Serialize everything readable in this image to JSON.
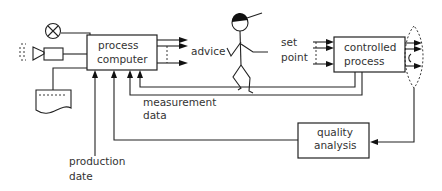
{
  "diagram": {
    "type": "process-control-flow",
    "nodes": {
      "process_computer": {
        "label_line1": "process",
        "label_line2": "computer"
      },
      "controlled_process": {
        "label_line1": "controlled",
        "label_line2": "process"
      },
      "quality_analysis": {
        "label_line1": "quality",
        "label_line2": "analysis"
      },
      "operator": {
        "icon": "stick-figure-operator"
      },
      "alarm_lamp": {
        "icon": "alarm-lamp-icon"
      },
      "loudspeaker": {
        "icon": "loudspeaker-icon"
      },
      "printer_output": {
        "icon": "printout-icon"
      }
    },
    "labels": {
      "advice": "advice",
      "set_point_line1": "set",
      "set_point_line2": "point",
      "measurement_line1": "measurement",
      "measurement_line2": "data",
      "production_line1": "production",
      "production_line2": "date"
    },
    "edges": [
      {
        "from": "process_computer",
        "to": "operator",
        "label": "advice"
      },
      {
        "from": "operator",
        "to": "controlled_process",
        "label": "set point"
      },
      {
        "from": "controlled_process",
        "to": "process_computer",
        "label": "measurement data"
      },
      {
        "from": "controlled_process",
        "to": "quality_analysis"
      },
      {
        "from": "quality_analysis",
        "to": "process_computer"
      },
      {
        "from": "production_input",
        "to": "process_computer",
        "label": "production date"
      },
      {
        "from": "process_computer",
        "to": "alarm_lamp"
      },
      {
        "from": "process_computer",
        "to": "loudspeaker"
      },
      {
        "from": "process_computer",
        "to": "printer_output"
      }
    ]
  }
}
